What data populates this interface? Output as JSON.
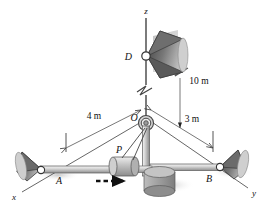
{
  "figure": {
    "kind": "engineering-mechanics-diagram"
  },
  "axes": [
    {
      "name": "z-axis",
      "label": "z",
      "x": 146,
      "y": 11
    },
    {
      "name": "x-axis",
      "label": "x",
      "x": 14,
      "y": 196
    },
    {
      "name": "y-axis",
      "label": "y",
      "x": 253,
      "y": 193
    }
  ],
  "points": [
    {
      "name": "point-d",
      "label": "D",
      "x": 118,
      "y": 55
    },
    {
      "name": "point-o",
      "label": "O",
      "x": 128,
      "y": 117
    },
    {
      "name": "point-p",
      "label": "P",
      "x": 117,
      "y": 152
    },
    {
      "name": "point-a",
      "label": "A",
      "x": 58,
      "y": 180
    },
    {
      "name": "point-b",
      "label": "B",
      "x": 210,
      "y": 178
    }
  ],
  "dimensions": [
    {
      "name": "dim-4m",
      "label": "4 m",
      "x": 94,
      "y": 116
    },
    {
      "name": "dim-3m",
      "label": "3 m",
      "x": 190,
      "y": 119
    },
    {
      "name": "dim-10m",
      "label": "10 m",
      "x": 196,
      "y": 81
    }
  ],
  "colors": {
    "line": "#333333",
    "rod_light": "#d8d8d8",
    "rod_dark": "#8a8a8a",
    "cone_dark": "#4a4a4a",
    "cone_light": "#c8c8c8",
    "collar": "#b8b8b8",
    "base": "#9a9a9a",
    "shadow": "#c9c9c9",
    "text": "#111111"
  },
  "annotations": {
    "motion_arrow": {
      "name": "motion-direction-arrow",
      "style": "dashed",
      "direction": "right"
    }
  }
}
